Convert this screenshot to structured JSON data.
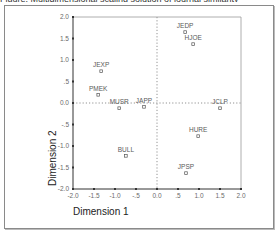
{
  "caption": "Figure: Multidimensional scaling solution of journal similarity",
  "chart_data": {
    "type": "scatter",
    "title": "",
    "xlabel": "Dimension 1",
    "ylabel": "Dimension 2",
    "xlim": [
      -2.0,
      2.0
    ],
    "ylim": [
      -2.0,
      2.0
    ],
    "x_ticks": [
      "-2.0",
      "-1.5",
      "-1.0",
      "-.5",
      "0.0",
      ".5",
      "1.0",
      "1.5",
      "2.0"
    ],
    "y_ticks": [
      "2.0",
      "1.5",
      "1.0",
      ".5",
      "0.0",
      "-.5",
      "-1.0",
      "-1.5",
      "-2.0"
    ],
    "grid": false,
    "reference_lines": {
      "x": 0.0,
      "y": 0.0,
      "style": "dotted"
    },
    "legend": null,
    "points": [
      {
        "label": "JEDP",
        "x": 0.67,
        "y": 1.65
      },
      {
        "label": "HJOE",
        "x": 0.86,
        "y": 1.37
      },
      {
        "label": "JEXP",
        "x": -1.33,
        "y": 0.74
      },
      {
        "label": "PMEK",
        "x": -1.4,
        "y": 0.19
      },
      {
        "label": "MUSR",
        "x": -0.9,
        "y": -0.12
      },
      {
        "label": "JAPP",
        "x": -0.31,
        "y": -0.09
      },
      {
        "label": "JCLP",
        "x": 1.5,
        "y": -0.12
      },
      {
        "label": "HURE",
        "x": 0.98,
        "y": -0.77
      },
      {
        "label": "BULL",
        "x": -0.74,
        "y": -1.23
      },
      {
        "label": "JPSP",
        "x": 0.69,
        "y": -1.63
      }
    ]
  },
  "colors": {
    "axis": "#333333",
    "marker": "#555555",
    "reference_line": "#777777"
  }
}
